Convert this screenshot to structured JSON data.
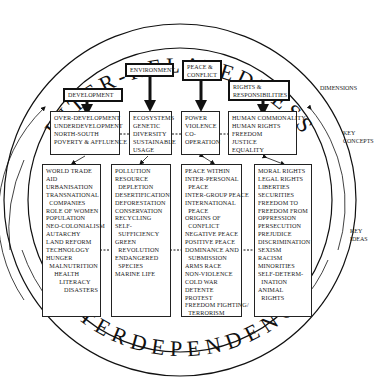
{
  "title_top": "INTER-RELATEDNESS",
  "title_bottom": "INTERDEPENDENCE",
  "side_labels": {
    "dimensions": "DIMENSIONS",
    "key_concepts": "KEY\nCONCEPTS",
    "key_ideas": "KEY\nIDEAS"
  },
  "dimensions": [
    {
      "label": "DEVELOPMENT"
    },
    {
      "label": "ENVIRONMENT"
    },
    {
      "label": "PEACE &\nCONFLICT"
    },
    {
      "label": "RIGHTS &\nRESPONSIBILITIES"
    }
  ],
  "key_concepts": [
    {
      "text": "OVER-DEVELOPMENT\nUNDERDEVELOPMENT\nNORTH-SOUTH\nPOVERTY & AFFLUENCE"
    },
    {
      "text": "ECOSYSTEMS\nGENETIC\nDIVERSITY\nSUSTAINABLE\nUSAGE"
    },
    {
      "text": "POWER\nVIOLENCE\nCO-\nOPERATION"
    },
    {
      "text": "HUMAN COMMONALITY\nHUMAN RIGHTS\nFREEDOM\nJUSTICE\nEQUALITY"
    }
  ],
  "key_ideas": [
    {
      "text": "WORLD TRADE\nAID\nURBANISATION\nTRANSNATIONAL\n  COMPANIES\nROLE OF WOMEN\nPOPULATION\nNEO-COLONIALISM\nAUTARCHY\nLAND REFORM\nTECHNOLOGY\nHUNGER\n  MALNUTRITION\n     HEALTH\n        LITERACY\n           DISASTERS"
    },
    {
      "text": "POLLUTION\nRESOURCE\n  DEPLETION\nDESERTIFICATION\nDEFORESTATION\nCONSERVATION\nRECYCLING\nSELF-\n  SUFFICIENCY\nGREEN\n  REVOLUTION\nENDANGERED\n  SPECIES\nMARINE LIFE"
    },
    {
      "text": "PEACE WITHIN\nINTER-PERSONAL\n  PEACE\nINTER-GROUP PEACE\nINTERNATIONAL\n  PEACE\nORIGINS OF\n  CONFLICT\nNEGATIVE PEACE\nPOSITIVE PEACE\nDOMINANCE AND\n  SUBMISSION\nARMS RACE\nNON-VIOLENCE\nCOLD WAR\nDETENTE\nPROTEST\nFREEDOM FIGHTING/\n  TERRORISM"
    },
    {
      "text": "MORAL RIGHTS\nLEGAL RIGHTS\nLIBERTIES\nSECURITIES\nFREEDOM TO\nFREEDOM FROM\nOPPRESSION\nPERSECUTION\nPREJUDICE\nDISCRIMINATION\nSEXISM\nRACISM\nMINORITIES\nSELF-DETERM-\n  INATION\nANIMAL\n  RIGHTS"
    }
  ]
}
